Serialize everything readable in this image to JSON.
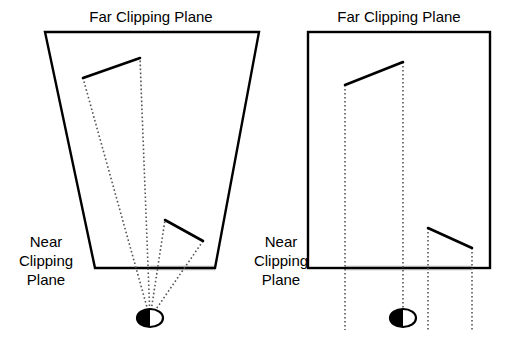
{
  "figure": {
    "type": "diagram",
    "background_color": "#ffffff",
    "line_color": "#000000",
    "dotted_color": "#555555",
    "highlight_band_color": "#d8d8d8"
  },
  "panels": [
    {
      "id": "perspective",
      "name": "perspective-frustum",
      "labels": {
        "far_plane": "Far Clipping Plane",
        "near_plane_line1": "Near",
        "near_plane_line2": "Clipping",
        "near_plane_line3": "Plane"
      },
      "far_plane_label_pos": {
        "x": 151,
        "y": 22
      },
      "near_plane_label_pos": {
        "x": 46,
        "y": 247
      },
      "frustum": {
        "top_left": {
          "x": 45,
          "y": 32
        },
        "top_right": {
          "x": 259,
          "y": 32
        },
        "bottom_right": {
          "x": 215,
          "y": 268
        },
        "bottom_left": {
          "x": 95,
          "y": 268
        }
      },
      "eye": {
        "x": 150,
        "y": 318,
        "rx": 13,
        "ry": 9
      },
      "objects": [
        {
          "name": "upper-object",
          "from": {
            "x": 83,
            "y": 78
          },
          "to": {
            "x": 140,
            "y": 58
          }
        },
        {
          "name": "lower-object",
          "from": {
            "x": 165,
            "y": 220
          },
          "to": {
            "x": 203,
            "y": 241
          }
        }
      ],
      "rays": [
        {
          "x": 83,
          "y": 78
        },
        {
          "x": 140,
          "y": 58
        },
        {
          "x": 165,
          "y": 220
        },
        {
          "x": 203,
          "y": 241
        }
      ],
      "highlight_band": {
        "x1": 150,
        "x2": 215,
        "y": 268
      }
    },
    {
      "id": "orthographic",
      "name": "orthographic-box",
      "labels": {
        "far_plane": "Far Clipping Plane",
        "near_plane_line1": "Near",
        "near_plane_line2": "Clipping",
        "near_plane_line3": "Plane"
      },
      "far_plane_label_pos": {
        "x": 399,
        "y": 22
      },
      "near_plane_label_pos": {
        "x": 281,
        "y": 247
      },
      "box": {
        "top_left": {
          "x": 308,
          "y": 32
        },
        "top_right": {
          "x": 490,
          "y": 32
        },
        "bottom_right": {
          "x": 490,
          "y": 268
        },
        "bottom_left": {
          "x": 308,
          "y": 268
        }
      },
      "eye": {
        "x": 403,
        "y": 318,
        "rx": 13,
        "ry": 9
      },
      "objects": [
        {
          "name": "upper-object",
          "from": {
            "x": 345,
            "y": 85
          },
          "to": {
            "x": 403,
            "y": 62
          }
        },
        {
          "name": "lower-object",
          "from": {
            "x": 428,
            "y": 228
          },
          "to": {
            "x": 472,
            "y": 248
          }
        }
      ],
      "rays": [
        {
          "x": 345,
          "y_top": 85,
          "y_bottom": 330
        },
        {
          "x": 403,
          "y_top": 62,
          "y_bottom": 330
        },
        {
          "x": 428,
          "y_top": 228,
          "y_bottom": 330
        },
        {
          "x": 472,
          "y_top": 248,
          "y_bottom": 330
        }
      ],
      "highlight_band": {
        "x1": 345,
        "x2": 472,
        "y": 268
      }
    }
  ]
}
